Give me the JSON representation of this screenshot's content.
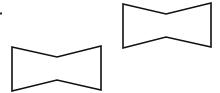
{
  "canvas": {
    "width": 220,
    "height": 93,
    "background": "#ffffff"
  },
  "stroke": {
    "color": "#111111",
    "width": 1.6
  },
  "marker": {
    "x": 1,
    "y": 13.5,
    "w": 2,
    "h": 2,
    "color": "#222222"
  },
  "shapes": [
    {
      "id": "bowtie-upper-right",
      "type": "concave-hexagon",
      "points": [
        [
          123,
          4
        ],
        [
          166,
          14
        ],
        [
          211,
          3
        ],
        [
          211,
          47
        ],
        [
          166,
          37
        ],
        [
          123,
          48
        ]
      ]
    },
    {
      "id": "bowtie-lower-left",
      "type": "concave-hexagon",
      "points": [
        [
          12,
          47
        ],
        [
          57,
          57
        ],
        [
          101,
          46
        ],
        [
          101,
          90
        ],
        [
          57,
          80
        ],
        [
          12,
          91
        ]
      ]
    }
  ]
}
